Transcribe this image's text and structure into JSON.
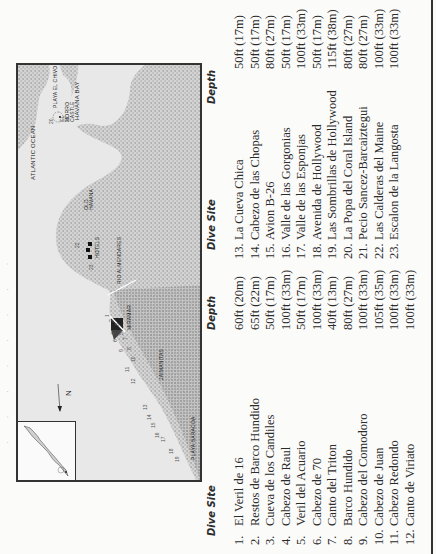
{
  "page": {
    "ghost_text": "· · · · · · · ·",
    "map": {
      "labels": {
        "atlantic_ocean": "ATLANTIC OCEAN",
        "havana_bay": "HAVANA BAY",
        "playa_el_chivo": "PLAYA EL CHIVO",
        "el_morro_castle": "EL MORRO CASTLE",
        "old_havana": "OLD HAVANA",
        "hotels": "HOTELS",
        "rio_almendares": "RIO ALMENDARES",
        "miramar": "MIRAMAR",
        "jaimanitas": "JAIMANITAS",
        "playa_baracoa": "PLAYA BARACOA",
        "north": "N"
      },
      "site_markers": [
        "1",
        "2",
        "3",
        "4",
        "5",
        "6",
        "7",
        "8",
        "9",
        "10",
        "11",
        "12",
        "13",
        "14",
        "15",
        "16",
        "17",
        "18",
        "19",
        "20",
        "21",
        "22",
        "23"
      ]
    },
    "table": {
      "headers": {
        "site": "Dive Site",
        "depth": "Depth"
      },
      "column1": [
        {
          "num": "1.",
          "site": "El Veril de 16",
          "depth": "60ft (20m)"
        },
        {
          "num": "2.",
          "site": "Restos de Barco Hundido",
          "depth": "65ft (22m)"
        },
        {
          "num": "3.",
          "site": "Cueva de los Candiles",
          "depth": "50ft (17m)"
        },
        {
          "num": "4.",
          "site": "Cabezo de Raul",
          "depth": "100ft (33m)"
        },
        {
          "num": "5.",
          "site": "Veril del Acuario",
          "depth": "50ft (17m)"
        },
        {
          "num": "6.",
          "site": "Cabezo de 70",
          "depth": "100ft (33m)"
        },
        {
          "num": "7.",
          "site": "Canto del Triton",
          "depth": "40ft (13m)"
        },
        {
          "num": "8.",
          "site": "Barco Hundido",
          "depth": "80ft (27m)"
        },
        {
          "num": "9.",
          "site": "Cabezo del Comodoro",
          "depth": "100ft (33m)"
        },
        {
          "num": "10.",
          "site": "Cabezo de Juan",
          "depth": "105ft (35m)"
        },
        {
          "num": "11.",
          "site": "Cabezo Redondo",
          "depth": "100ft (33m)"
        },
        {
          "num": "12.",
          "site": "Canto de Viriato",
          "depth": "100ft (33m)"
        }
      ],
      "column2": [
        {
          "num": "13.",
          "site": "La Cueva Chica",
          "depth": "50ft (17m)"
        },
        {
          "num": "14.",
          "site": "Cabezo de las Chopas",
          "depth": "50ft (17m)"
        },
        {
          "num": "15.",
          "site": "Avion B-26",
          "depth": "80ft (27m)"
        },
        {
          "num": "16.",
          "site": "Valle de las Gorgonias",
          "depth": "50ft (17m)"
        },
        {
          "num": "17.",
          "site": "Valle de las Esponjas",
          "depth": "100ft (33m)"
        },
        {
          "num": "18.",
          "site": "Avenida de Hollywood",
          "depth": "50ft (17m)"
        },
        {
          "num": "19.",
          "site": "Las Sombrillas de Hollywood",
          "depth": "115ft (38m)"
        },
        {
          "num": "20.",
          "site": "La Popa del Coral Island",
          "depth": "80ft (27m)"
        },
        {
          "num": "21.",
          "site": "Pecio Sancez-Barcaiztegui",
          "depth": "80ft (27m)"
        },
        {
          "num": "22.",
          "site": "Las Calderas del Maine",
          "depth": "100ft (33m)"
        },
        {
          "num": "23.",
          "site": "Escalon de la Langosta",
          "depth": "100ft (33m)"
        }
      ]
    }
  }
}
